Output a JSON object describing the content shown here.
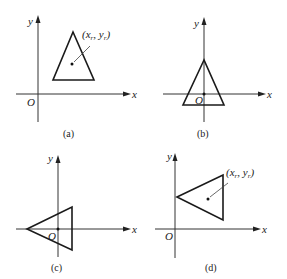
{
  "figure": {
    "panels": [
      {
        "id": "a",
        "caption": "(a)",
        "axis_x_label": "x",
        "axis_y_label": "y",
        "origin_label": "O",
        "ref_label_base_x": "(x",
        "ref_label_sub_x": "r",
        "ref_label_sep": ", y",
        "ref_label_sub_y": "r",
        "ref_label_close": ")",
        "description": "Triangle located in first quadrant, reference point inside triangle"
      },
      {
        "id": "b",
        "caption": "(b)",
        "axis_x_label": "x",
        "axis_y_label": "y",
        "origin_label": "O",
        "description": "Triangle translated so reference point coincides with origin"
      },
      {
        "id": "c",
        "caption": "(c)",
        "axis_x_label": "x",
        "axis_y_label": "y",
        "origin_label": "O",
        "description": "Triangle rotated about origin"
      },
      {
        "id": "d",
        "caption": "(d)",
        "axis_x_label": "x",
        "axis_y_label": "y",
        "origin_label": "O",
        "ref_label_base_x": "(x",
        "ref_label_sub_x": "r",
        "ref_label_sep": ", y",
        "ref_label_sub_y": "r",
        "ref_label_close": ")",
        "description": "Rotated triangle translated back so reference point returns to original position"
      }
    ],
    "colors": {
      "background": "#ffffff",
      "stroke": "#1a1a1a",
      "axis": "#333333"
    }
  }
}
